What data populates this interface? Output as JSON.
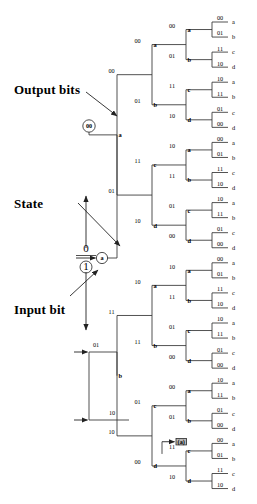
{
  "figure": {
    "type": "code-tree",
    "annotations": [
      {
        "id": "output-bits",
        "text": "Output bits",
        "x": 14,
        "y": 82,
        "arrow_from": [
          86,
          92
        ],
        "arrow_to": [
          117,
          116
        ]
      },
      {
        "id": "state",
        "text": "State",
        "x": 14,
        "y": 196,
        "arrow_from": [
          78,
          203
        ],
        "arrow_to": [
          120,
          246
        ]
      },
      {
        "id": "input-bit",
        "text": "Input bit",
        "x": 14,
        "y": 302,
        "arrow_from": [
          70,
          296
        ],
        "arrow_to": [
          98,
          270
        ]
      }
    ],
    "root": {
      "top_bit": "0",
      "bottom_bit": "1",
      "output_circle": "00",
      "state_circle": "a",
      "branch_up_label": "00",
      "branch_down_label": "01",
      "node_up": "a",
      "node_down": "b"
    },
    "depth1": [
      {
        "output": "00",
        "state": "a"
      },
      {
        "output": "01",
        "state": "b"
      },
      {
        "output": "11",
        "state": "c"
      },
      {
        "output": "10",
        "state": "d"
      }
    ],
    "depth2": [
      {
        "output": "00",
        "state": "a"
      },
      {
        "output": "01",
        "state": "b"
      },
      {
        "output": "11",
        "state": "c"
      },
      {
        "output": "10",
        "state": "d"
      },
      {
        "output": "10",
        "state": "a"
      },
      {
        "output": "11",
        "state": "b"
      },
      {
        "output": "01",
        "state": "c"
      },
      {
        "output": "00",
        "state": "d"
      },
      {
        "output": "10",
        "state": "a"
      },
      {
        "output": "11",
        "state": "b"
      },
      {
        "output": "01",
        "state": "c"
      },
      {
        "output": "00",
        "state": "d"
      },
      {
        "output": "00",
        "state": "a"
      },
      {
        "output": "01",
        "state": "b"
      },
      {
        "output": "11",
        "state": "c"
      },
      {
        "output": "10",
        "state": "d"
      }
    ],
    "leaves": [
      {
        "output": "00",
        "state": "a"
      },
      {
        "output": "01",
        "state": "b"
      },
      {
        "output": "11",
        "state": "c"
      },
      {
        "output": "10",
        "state": "d"
      },
      {
        "output": "10",
        "state": "a"
      },
      {
        "output": "11",
        "state": "b"
      },
      {
        "output": "01",
        "state": "c"
      },
      {
        "output": "00",
        "state": "d"
      },
      {
        "output": "00",
        "state": "a"
      },
      {
        "output": "01",
        "state": "b"
      },
      {
        "output": "11",
        "state": "c"
      },
      {
        "output": "10",
        "state": "d"
      },
      {
        "output": "10",
        "state": "a"
      },
      {
        "output": "11",
        "state": "b"
      },
      {
        "output": "01",
        "state": "c"
      },
      {
        "output": "00",
        "state": "d"
      },
      {
        "output": "00",
        "state": "a"
      },
      {
        "output": "01",
        "state": "b"
      },
      {
        "output": "11",
        "state": "c"
      },
      {
        "output": "10",
        "state": "d"
      },
      {
        "output": "10",
        "state": "a"
      },
      {
        "output": "11",
        "state": "b"
      },
      {
        "output": "01",
        "state": "c"
      },
      {
        "output": "00",
        "state": "d"
      },
      {
        "output": "10",
        "state": "a"
      },
      {
        "output": "11",
        "state": "b"
      },
      {
        "output": "01",
        "state": "c"
      },
      {
        "output": "00",
        "state": "d"
      },
      {
        "output": "00",
        "state": "a"
      },
      {
        "output": "01",
        "state": "b"
      },
      {
        "output": "11",
        "state": "c"
      },
      {
        "output": "10",
        "state": "d"
      }
    ],
    "highlight": {
      "state": "(a)",
      "output": "01"
    },
    "colors": {
      "stroke": "#333333",
      "text": "#000000",
      "highlight": "#b9b9b9"
    }
  }
}
